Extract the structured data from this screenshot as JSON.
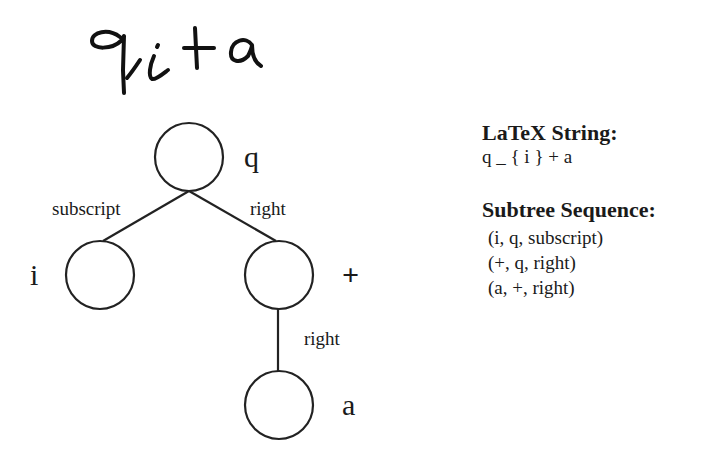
{
  "handwritten_input": "q_i + a",
  "tree": {
    "nodes": [
      {
        "id": "q",
        "label": "q",
        "cx": 189,
        "cy": 157
      },
      {
        "id": "i",
        "label": "i",
        "cx": 100,
        "cy": 275
      },
      {
        "id": "plus",
        "label": "+",
        "cx": 279,
        "cy": 275
      },
      {
        "id": "a",
        "label": "a",
        "cx": 279,
        "cy": 405
      }
    ],
    "edges": [
      {
        "from": "q",
        "to": "i",
        "label": "subscript"
      },
      {
        "from": "q",
        "to": "plus",
        "label": "right"
      },
      {
        "from": "plus",
        "to": "a",
        "label": "right"
      }
    ]
  },
  "latex": {
    "heading": "LaTeX String:",
    "value": "q _ { i } + a"
  },
  "subtree": {
    "heading": "Subtree Sequence:",
    "items": [
      "(i, q, subscript)",
      "(+, q, right)",
      "(a, +, right)"
    ]
  }
}
